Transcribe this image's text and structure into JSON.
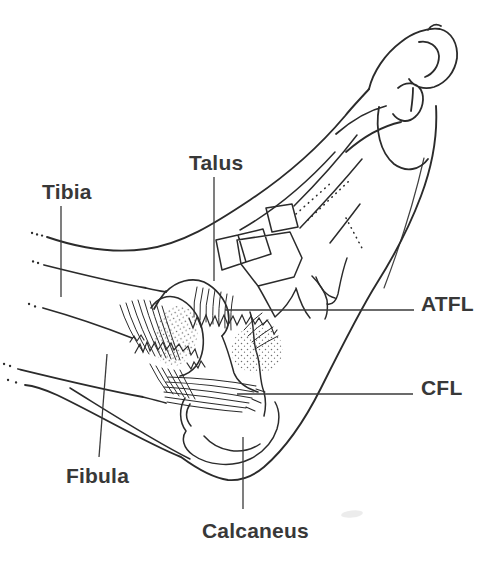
{
  "labels": {
    "tibia": "Tibia",
    "talus": "Talus",
    "fibula": "Fibula",
    "calcaneus": "Calcaneus",
    "atfl": "ATFL",
    "cfl": "CFL"
  },
  "colors": {
    "background": "#ffffff",
    "line": "#2b2b2b",
    "leader_line": "#3a3a3a",
    "label_text": "#383838",
    "stipple": "#4a4a4a"
  }
}
